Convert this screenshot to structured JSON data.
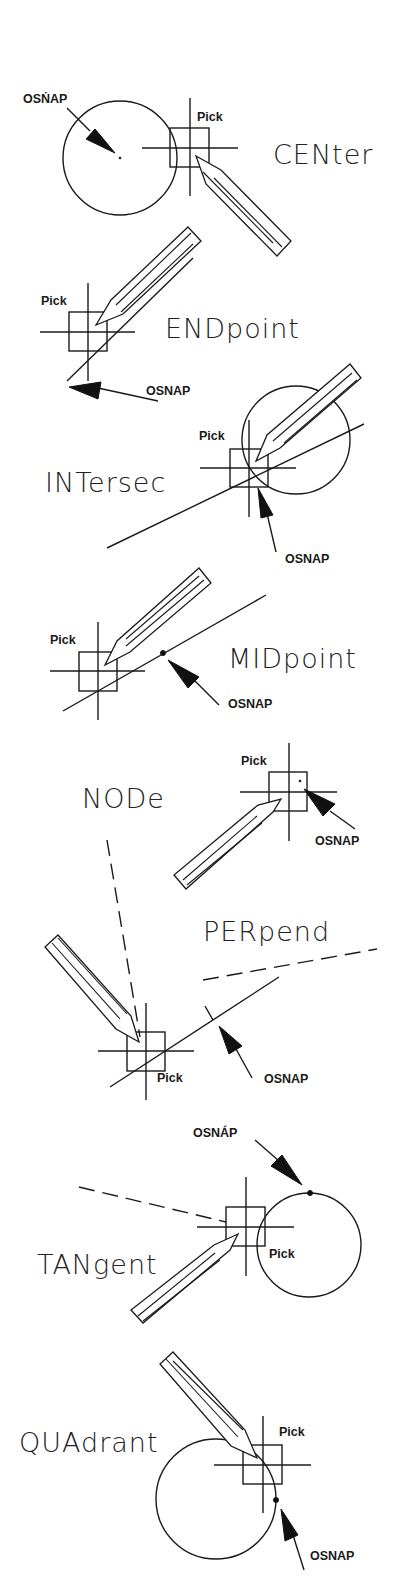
{
  "diagram": {
    "colors": {
      "ink": "#1a1a1a",
      "background": "#ffffff"
    },
    "common_labels": {
      "pick": "Pick",
      "osnap": "OSNAP"
    },
    "sections": [
      {
        "id": "center",
        "mode_label": "CENter",
        "pick_label": "Pick",
        "osnap_label": "OSNAP",
        "osnap_label_variant": "OSṄAP"
      },
      {
        "id": "endpoint",
        "mode_label": "ENDpoint",
        "pick_label": "Pick",
        "osnap_label": "OSNAP"
      },
      {
        "id": "intersection",
        "mode_label": "INTersec",
        "pick_label": "Pick",
        "osnap_label": "OSNAP"
      },
      {
        "id": "midpoint",
        "mode_label": "MIDpoint",
        "pick_label": "Pick",
        "osnap_label": "OSNAP"
      },
      {
        "id": "node",
        "mode_label": "NODe",
        "pick_label": "Pick",
        "osnap_label": "OSNAP"
      },
      {
        "id": "perpendicular",
        "mode_label": "PERpend",
        "pick_label": "Pick",
        "osnap_label": "OSNAP"
      },
      {
        "id": "tangent",
        "mode_label": "TANgent",
        "pick_label": "Pick",
        "osnap_label": "OSNÁP"
      },
      {
        "id": "quadrant",
        "mode_label": "QUAdrant",
        "pick_label": "Pick",
        "osnap_label": "OSNAP"
      }
    ],
    "icons": {
      "pencil": "pencil-cursor-icon",
      "crosshair": "crosshair-pickbox-icon",
      "arrow": "osnap-arrow-icon"
    }
  }
}
